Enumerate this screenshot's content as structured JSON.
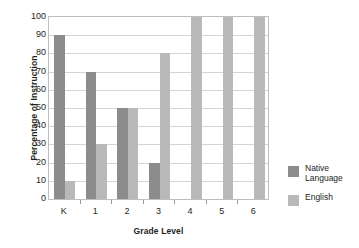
{
  "chart_data": {
    "type": "bar",
    "title": "",
    "xlabel": "Grade Level",
    "ylabel": "Percentage of Instruction",
    "categories": [
      "K",
      "1",
      "2",
      "3",
      "4",
      "5",
      "6"
    ],
    "series": [
      {
        "name": "Native Language",
        "color": "#8c8c8c",
        "values": [
          90,
          70,
          50,
          20,
          0,
          0,
          0
        ]
      },
      {
        "name": "English",
        "color": "#b9b9b9",
        "values": [
          10,
          30,
          50,
          80,
          100,
          100,
          100
        ]
      }
    ],
    "ylim": [
      0,
      100
    ],
    "yticks": [
      100,
      90,
      80,
      70,
      60,
      50,
      40,
      30,
      20,
      10,
      0
    ],
    "ytick_labels": [
      "100",
      "90",
      "80",
      "70",
      "60",
      "50",
      "40",
      "30",
      "20",
      "10",
      "0"
    ],
    "grid": true,
    "grid_axis": "y",
    "legend_position": "right"
  },
  "legend": {
    "entries": [
      {
        "label": "Native\nLanguage",
        "swatch": "#8c8c8c"
      },
      {
        "label": "English",
        "swatch": "#b9b9b9"
      }
    ]
  },
  "axes": {
    "y_title": "Percentage of Instruction",
    "x_title": "Grade Level"
  }
}
